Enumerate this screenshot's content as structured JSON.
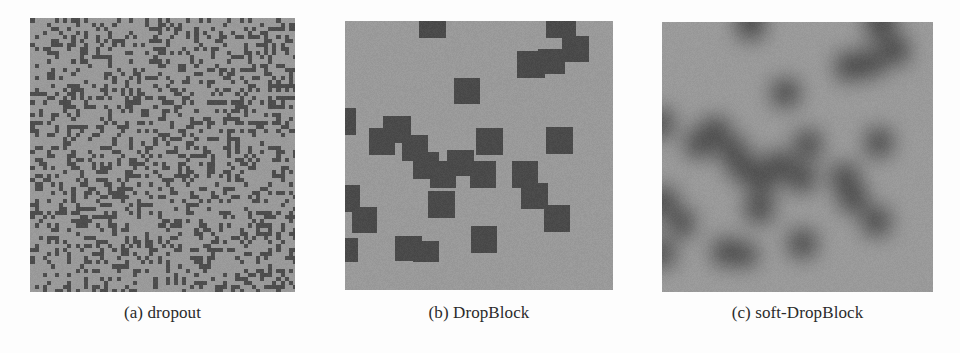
{
  "figure": {
    "background_color": "#fdfdfd",
    "caption_color": "#2b2b2b",
    "panels": [
      {
        "id": "a",
        "caption": "(a) dropout",
        "mode": "pixel",
        "x": 30,
        "y": 18,
        "width": 265,
        "height": 274,
        "base_color": "#9a9a9a",
        "mask_color": "#4d4d4d",
        "noise": 9,
        "cell_size": 4.1,
        "drop_rate": 0.3,
        "seed": 20394
      },
      {
        "id": "b",
        "caption": "(b) DropBlock",
        "mode": "block",
        "x": 345,
        "y": 21,
        "width": 268,
        "height": 269,
        "base_color": "#9a9a9a",
        "mask_color": "#4a4a4a",
        "noise": 9,
        "blur": 0,
        "unit": 26.5,
        "blocks": [
          [
            2.8,
            -0.35,
            1.0,
            1.0
          ],
          [
            7.6,
            -0.35,
            1.1,
            1.0
          ],
          [
            8.2,
            0.55,
            1.0,
            1.0
          ],
          [
            6.5,
            1.15,
            1.05,
            1.0
          ],
          [
            7.3,
            1.05,
            1.0,
            0.95
          ],
          [
            4.1,
            2.15,
            1.0,
            1.0
          ],
          [
            -0.35,
            3.3,
            0.75,
            1.0
          ],
          [
            0.9,
            4.05,
            1.0,
            1.0
          ],
          [
            1.45,
            3.6,
            1.05,
            1.0
          ],
          [
            2.15,
            4.3,
            1.0,
            1.0
          ],
          [
            2.55,
            4.95,
            1.0,
            1.0
          ],
          [
            3.2,
            5.3,
            1.0,
            1.0
          ],
          [
            3.85,
            4.85,
            1.0,
            1.0
          ],
          [
            4.95,
            4.05,
            1.0,
            1.0
          ],
          [
            4.7,
            5.3,
            1.0,
            1.0
          ],
          [
            7.6,
            4.0,
            1.0,
            1.0
          ],
          [
            6.3,
            5.3,
            1.0,
            1.0
          ],
          [
            6.65,
            6.1,
            1.0,
            1.0
          ],
          [
            3.15,
            6.4,
            1.0,
            1.05
          ],
          [
            -0.4,
            6.2,
            0.95,
            1.0
          ],
          [
            0.25,
            7.0,
            0.95,
            1.0
          ],
          [
            7.5,
            6.95,
            1.0,
            1.0
          ],
          [
            4.75,
            7.75,
            1.0,
            1.0
          ],
          [
            1.9,
            8.1,
            1.0,
            0.95
          ],
          [
            2.55,
            8.3,
            1.0,
            0.8
          ],
          [
            -0.4,
            8.2,
            0.9,
            0.9
          ]
        ]
      },
      {
        "id": "c",
        "caption": "(c) soft-DropBlock",
        "mode": "block",
        "x": 662,
        "y": 22,
        "width": 271,
        "height": 270,
        "base_color": "#9a9a9a",
        "mask_color": "#4a4a4a",
        "noise": 8,
        "blur": 9,
        "unit": 26.8,
        "blocks": [
          [
            2.8,
            -0.35,
            1.0,
            1.0
          ],
          [
            7.6,
            -0.35,
            1.1,
            1.0
          ],
          [
            8.2,
            0.55,
            1.0,
            1.0
          ],
          [
            6.5,
            1.15,
            1.05,
            1.0
          ],
          [
            7.3,
            1.05,
            1.0,
            0.95
          ],
          [
            4.1,
            2.15,
            1.0,
            1.0
          ],
          [
            -0.35,
            3.3,
            0.75,
            1.0
          ],
          [
            0.9,
            4.05,
            1.0,
            1.0
          ],
          [
            1.45,
            3.6,
            1.05,
            1.0
          ],
          [
            2.15,
            4.3,
            1.0,
            1.0
          ],
          [
            2.55,
            4.95,
            1.0,
            1.0
          ],
          [
            3.2,
            5.3,
            1.0,
            1.0
          ],
          [
            3.85,
            4.85,
            1.0,
            1.0
          ],
          [
            4.95,
            4.05,
            1.0,
            1.0
          ],
          [
            4.7,
            5.3,
            1.0,
            1.0
          ],
          [
            7.6,
            4.0,
            1.0,
            1.0
          ],
          [
            6.3,
            5.3,
            1.0,
            1.0
          ],
          [
            6.65,
            6.1,
            1.0,
            1.0
          ],
          [
            3.15,
            6.4,
            1.0,
            1.05
          ],
          [
            -0.4,
            6.2,
            0.95,
            1.0
          ],
          [
            0.25,
            7.0,
            0.95,
            1.0
          ],
          [
            7.5,
            6.95,
            1.0,
            1.0
          ],
          [
            4.75,
            7.75,
            1.0,
            1.0
          ],
          [
            1.9,
            8.1,
            1.0,
            0.95
          ],
          [
            2.55,
            8.3,
            1.0,
            0.8
          ],
          [
            -0.4,
            8.2,
            0.9,
            0.9
          ]
        ]
      }
    ]
  }
}
